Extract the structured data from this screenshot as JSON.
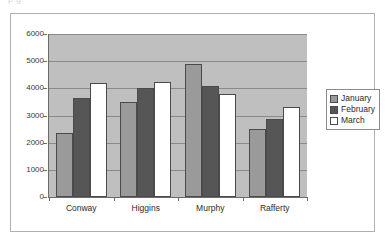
{
  "page": {
    "top_partial_text": "p                        g"
  },
  "chart_data": {
    "type": "bar",
    "title": "",
    "subtitle": "",
    "xlabel": "",
    "ylabel": "",
    "categories": [
      "Conway",
      "Higgins",
      "Murphy",
      "Rafferty"
    ],
    "series": [
      {
        "name": "January",
        "color": "#9a9a9a",
        "values": [
          2350,
          3480,
          4900,
          2520
        ]
      },
      {
        "name": "February",
        "color": "#565656",
        "values": [
          3650,
          4000,
          4070,
          2870
        ]
      },
      {
        "name": "March",
        "color": "#ffffff",
        "values": [
          4200,
          4220,
          3800,
          3300
        ]
      }
    ],
    "ylim": [
      0,
      6000
    ],
    "ytick_values": [
      6000,
      5000,
      4000,
      3000,
      2000,
      1000,
      0
    ],
    "ytick_labels": [
      "6000",
      "5000",
      "4000",
      "3000",
      "2000",
      "1000",
      "0"
    ],
    "grid": true,
    "legend_position": "right",
    "plot_background": "#bfbfbf",
    "axis_color": "#6b6b6b",
    "gridline_color": "#8a8a8a"
  },
  "legend": {
    "entries": [
      {
        "label": "January"
      },
      {
        "label": "February"
      },
      {
        "label": "March"
      }
    ]
  }
}
